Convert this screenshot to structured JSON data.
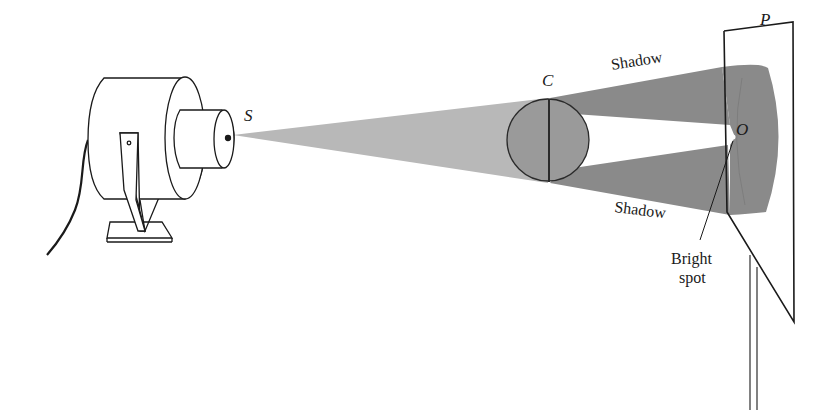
{
  "figure": {
    "colors": {
      "background": "#ffffff",
      "line": "#1a1a1a",
      "light_cone": "#b8b8b8",
      "shadow": "#8a8a8a",
      "disk": "#9a9a9a"
    },
    "labels": {
      "source": "S",
      "disk": "C",
      "screen": "P",
      "center": "O",
      "shadow_top": "Shadow",
      "shadow_bottom": "Shadow",
      "bright_line1": "Bright",
      "bright_line2": "spot"
    },
    "components": [
      {
        "id": "lamp",
        "name": "Point light source (lamp housing)"
      },
      {
        "id": "disk",
        "name": "Opaque circular disk C"
      },
      {
        "id": "screen",
        "name": "Screen P on stand"
      },
      {
        "id": "shadow",
        "name": "Shadow region"
      },
      {
        "id": "bright-spot",
        "name": "Bright spot O"
      }
    ]
  }
}
